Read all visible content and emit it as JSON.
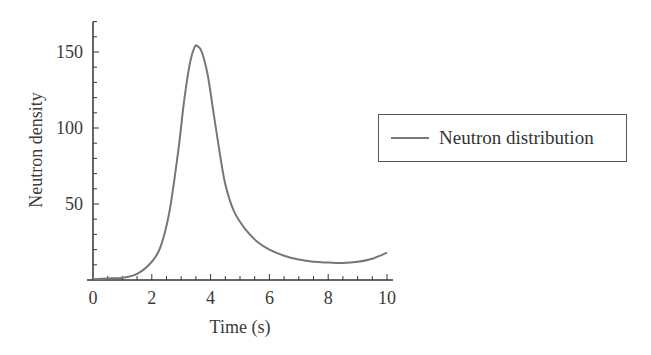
{
  "chart_data": {
    "type": "line",
    "title": "",
    "xlabel": "Time (s)",
    "ylabel": "Neutron density",
    "xlim": [
      0,
      10
    ],
    "ylim": [
      0,
      170
    ],
    "xticks": [
      0,
      2,
      4,
      6,
      8,
      10
    ],
    "yticks": [
      50,
      100,
      150
    ],
    "grid": false,
    "legend_position": "right",
    "series": [
      {
        "name": "Neutron distribution",
        "color": "#777777",
        "x": [
          0,
          0.5,
          1.0,
          1.5,
          2.0,
          2.3,
          2.6,
          2.9,
          3.1,
          3.3,
          3.45,
          3.55,
          3.7,
          3.9,
          4.1,
          4.3,
          4.5,
          4.8,
          5.2,
          5.6,
          6.0,
          6.5,
          7.0,
          7.5,
          8.0,
          8.5,
          9.0,
          9.5,
          10.0
        ],
        "y": [
          0.5,
          1,
          1.5,
          4,
          12,
          22,
          45,
          85,
          118,
          143,
          153,
          154,
          150,
          135,
          110,
          85,
          63,
          45,
          33,
          25,
          20,
          16,
          13.5,
          12,
          11.5,
          11.2,
          12,
          14,
          18
        ]
      }
    ]
  },
  "axes": {
    "x_tick_labels": [
      "0",
      "2",
      "4",
      "6",
      "8",
      "10"
    ],
    "y_tick_labels": [
      "50",
      "100",
      "150"
    ],
    "x_title": "Time (s)",
    "y_title": "Neutron density"
  },
  "legend": {
    "label": "Neutron distribution"
  }
}
